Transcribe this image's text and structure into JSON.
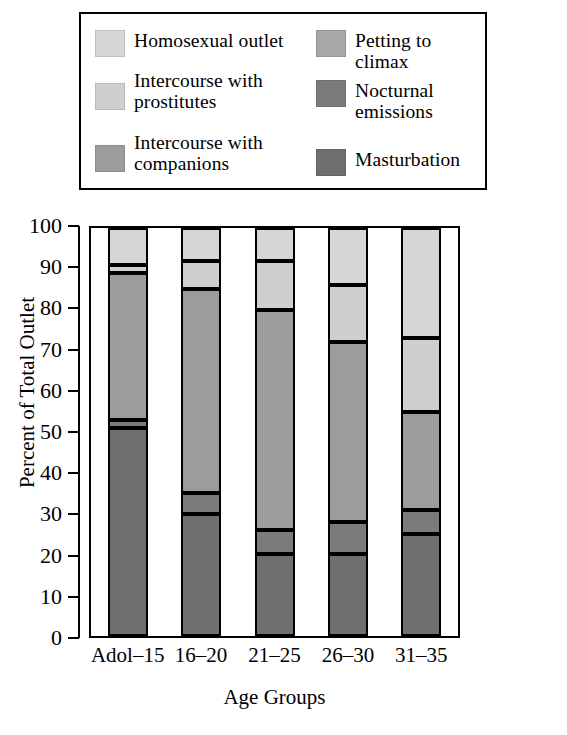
{
  "legend": {
    "items": [
      {
        "key": "homosexual",
        "label": "Homosexual outlet",
        "color": "#d6d6d6",
        "column": "left"
      },
      {
        "key": "prostitutes",
        "label": "Intercourse with\nprostitutes",
        "color": "#cfcfcf",
        "column": "left"
      },
      {
        "key": "companions",
        "label": "Intercourse with\ncompanions",
        "color": "#9c9c9c",
        "column": "left"
      },
      {
        "key": "petting",
        "label": "Petting to climax",
        "color": "#a8a8a8",
        "column": "right"
      },
      {
        "key": "nocturnal",
        "label": "Nocturnal emissions",
        "color": "#7b7b7b",
        "column": "right"
      },
      {
        "key": "masturbation",
        "label": "Masturbation",
        "color": "#6f6f6f",
        "column": "right"
      }
    ]
  },
  "chart_data": {
    "type": "bar",
    "subtype": "stacked",
    "title": "",
    "xlabel": "Age Groups",
    "ylabel": "Percent of Total Outlet",
    "ylim": [
      0,
      100
    ],
    "yticks": [
      0,
      10,
      20,
      30,
      40,
      50,
      60,
      70,
      80,
      90,
      100
    ],
    "grid": false,
    "legend_position": "top",
    "categories": [
      "Adol–15",
      "16–20",
      "21–25",
      "26–30",
      "31–35"
    ],
    "series": [
      {
        "name": "Masturbation",
        "color": "#6f6f6f",
        "values": [
          51,
          30,
          20,
          20,
          25
        ]
      },
      {
        "name": "Nocturnal emissions",
        "color": "#7b7b7b",
        "values": [
          2,
          5,
          6,
          8,
          6
        ]
      },
      {
        "name": "Intercourse with companions",
        "color": "#9c9c9c",
        "values": [
          36,
          50,
          54,
          44,
          24
        ]
      },
      {
        "name": "Petting to climax",
        "color": "#a8a8a8",
        "values": [
          0,
          0,
          0,
          0,
          0
        ]
      },
      {
        "name": "Intercourse with prostitutes",
        "color": "#cfcfcf",
        "values": [
          2,
          7,
          12,
          14,
          18
        ]
      },
      {
        "name": "Homosexual outlet",
        "color": "#d6d6d6",
        "values": [
          9,
          8,
          8,
          14,
          27
        ]
      }
    ],
    "stack_boundaries": [
      {
        "category": "Adol–15",
        "cuts": [
          51,
          53,
          89,
          91,
          100
        ]
      },
      {
        "category": "16–20",
        "cuts": [
          30,
          35,
          85,
          92,
          100
        ]
      },
      {
        "category": "21–25",
        "cuts": [
          20,
          26,
          80,
          92,
          100
        ]
      },
      {
        "category": "26–30",
        "cuts": [
          20,
          28,
          72,
          86,
          100
        ]
      },
      {
        "category": "31–35",
        "cuts": [
          25,
          31,
          55,
          73,
          100
        ]
      }
    ]
  }
}
